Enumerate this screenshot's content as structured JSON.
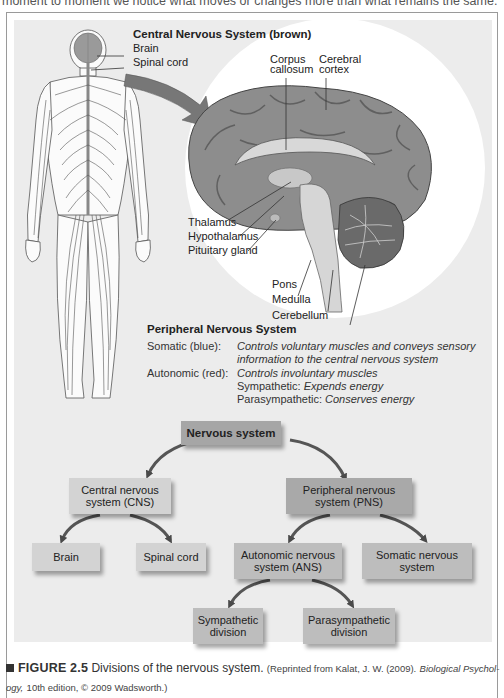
{
  "page": {
    "top_text": "moment to moment we notice what moves or changes more than what remains the same."
  },
  "figure": {
    "cns_title": "Central Nervous System (brown)",
    "body_labels": {
      "brain": "Brain",
      "spinal_cord": "Spinal cord"
    },
    "brain_labels": {
      "corpus_callosum_1": "Corpus",
      "corpus_callosum_2": "callosum",
      "cerebral_cortex_1": "Cerebral",
      "cerebral_cortex_2": "cortex",
      "thalamus": "Thalamus",
      "hypothalamus": "Hypothalamus",
      "pituitary": "Pituitary gland",
      "pons": "Pons",
      "medulla": "Medulla",
      "cerebellum": "Cerebellum"
    },
    "pns": {
      "title": "Peripheral Nervous System",
      "somatic_key": "Somatic (blue):",
      "somatic_val_1": "Controls voluntary muscles and conveys sensory",
      "somatic_val_2": "information to the central nervous system",
      "autonomic_key": "Autonomic (red):",
      "autonomic_val": "Controls involuntary muscles",
      "sympathetic_key": "Sympathetic:",
      "sympathetic_val": "Expends energy",
      "parasympathetic_key": "Parasympathetic:",
      "parasympathetic_val": "Conserves energy"
    },
    "flowchart": {
      "root": "Nervous system",
      "cns_1": "Central nervous",
      "cns_2": "system (CNS)",
      "pns_1": "Peripheral nervous",
      "pns_2": "system (PNS)",
      "brain": "Brain",
      "spinal_cord": "Spinal cord",
      "ans_1": "Autonomic nervous",
      "ans_2": "system (ANS)",
      "sns_1": "Somatic nervous",
      "sns_2": "system",
      "symp_1": "Sympathetic",
      "symp_2": "division",
      "para_1": "Parasympathetic",
      "para_2": "division"
    },
    "caption": {
      "number": "FIGURE 2.5",
      "title": "Divisions of the nervous system.",
      "credit_pre": "(Reprinted from Kalat, J. W. (2009).",
      "credit_book_1": "Biological Psychol-",
      "credit_book_2": "ogy,",
      "credit_post": "10th edition, © 2009 Wadsworth.)"
    }
  },
  "colors": {
    "panel_bg": "#ececec",
    "box_light": "#d3d3d3",
    "box_mid": "#bdbdbd",
    "box_dark": "#a9a9a9",
    "arrow": "#555555"
  }
}
